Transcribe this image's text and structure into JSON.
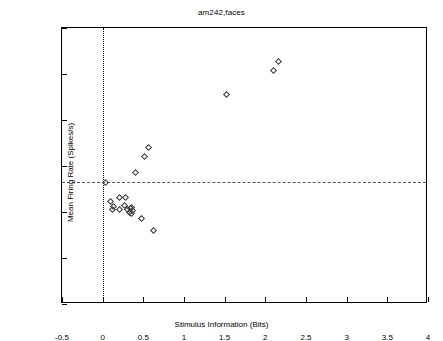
{
  "chart_data": {
    "type": "scatter",
    "title": "am242,faces",
    "xlabel": "Stimulus Information (Bits)",
    "ylabel": "Mean Firing Rate (Spikes/s)",
    "xlim": [
      -0.5,
      4
    ],
    "ylim": [
      0,
      120
    ],
    "xticks": [
      -0.5,
      0,
      0.5,
      1,
      1.5,
      2,
      2.5,
      3,
      3.5,
      4
    ],
    "xticklabels": [
      "-0.5",
      "0",
      "0.5",
      "1",
      "1.5",
      "2",
      "2.5",
      "3",
      "3.5",
      "4"
    ],
    "yticks": [
      0,
      20,
      40,
      60,
      80,
      100,
      120
    ],
    "yticklabels": [
      "0",
      "20",
      "40",
      "60",
      "80",
      "100",
      "120"
    ],
    "grid": false,
    "legend": null,
    "marker": "open-diamond",
    "marker_color": "#3a3a3a",
    "reference_lines": [
      {
        "orientation": "vertical",
        "value": 0,
        "style": "dotted",
        "color": "#000000"
      },
      {
        "orientation": "horizontal",
        "value": 53,
        "style": "dashed",
        "color": "#555555"
      }
    ],
    "points": [
      {
        "x": 0.03,
        "y": 53.0
      },
      {
        "x": 0.1,
        "y": 44.5
      },
      {
        "x": 0.13,
        "y": 42.5
      },
      {
        "x": 0.21,
        "y": 46.5
      },
      {
        "x": 0.28,
        "y": 46.5
      },
      {
        "x": 0.12,
        "y": 41.0
      },
      {
        "x": 0.21,
        "y": 41.0
      },
      {
        "x": 0.27,
        "y": 43.0
      },
      {
        "x": 0.31,
        "y": 41.0
      },
      {
        "x": 0.33,
        "y": 40.0
      },
      {
        "x": 0.34,
        "y": 41.5
      },
      {
        "x": 0.35,
        "y": 39.5
      },
      {
        "x": 0.36,
        "y": 42.0
      },
      {
        "x": 0.37,
        "y": 40.5
      },
      {
        "x": 0.48,
        "y": 37.0
      },
      {
        "x": 0.62,
        "y": 32.0
      },
      {
        "x": 0.4,
        "y": 57.0
      },
      {
        "x": 0.52,
        "y": 64.0
      },
      {
        "x": 0.56,
        "y": 68.0
      },
      {
        "x": 1.52,
        "y": 91.0
      },
      {
        "x": 2.1,
        "y": 101.5
      },
      {
        "x": 2.16,
        "y": 105.5
      }
    ]
  }
}
